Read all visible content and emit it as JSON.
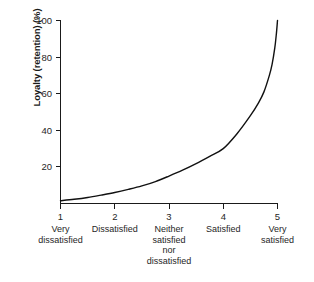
{
  "chart_data": {
    "type": "line",
    "title": "",
    "xlabel": "",
    "ylabel": "Loyalty (retention) (%)",
    "xlim": [
      1,
      5
    ],
    "ylim": [
      0,
      100
    ],
    "grid": false,
    "legend": "none",
    "x_tick_labels": [
      "1",
      "2",
      "3",
      "4",
      "5"
    ],
    "x_category_labels": [
      "Very\ndissatisfied",
      "Dissatisfied",
      "Neither\nsatisfied\nnor\ndissatisfied",
      "Satisfied",
      "Very\nsatisfied"
    ],
    "x_categories": [
      [
        "Very",
        "dissatisfied"
      ],
      [
        "Dissatisfied"
      ],
      [
        "Neither",
        "satisfied",
        "nor",
        "dissatisfied"
      ],
      [
        "Satisfied"
      ],
      [
        "Very",
        "satisfied"
      ]
    ],
    "y_tick_labels": [
      "20",
      "40",
      "60",
      "80",
      "100"
    ],
    "y_ticks": [
      20,
      40,
      60,
      80,
      100
    ],
    "series": [
      {
        "name": "Loyalty (retention)",
        "color": "#111111",
        "x": [
          1.0,
          1.25,
          1.5,
          1.75,
          2.0,
          2.25,
          2.5,
          2.75,
          3.0,
          3.25,
          3.5,
          3.75,
          4.0,
          4.25,
          4.5,
          4.65,
          4.75,
          4.85,
          4.9,
          4.95,
          4.98,
          5.0
        ],
        "y": [
          1.5,
          2.3,
          3.3,
          4.6,
          6.0,
          7.7,
          9.6,
          12.0,
          15.0,
          18.2,
          21.8,
          25.8,
          30.0,
          38.0,
          48.0,
          55.0,
          61.0,
          70.0,
          76.0,
          85.0,
          93.0,
          100.0
        ]
      }
    ],
    "axis_color": "#1a1a1a",
    "background_color": "#ffffff"
  },
  "figure": {
    "background_color": "#ffffff"
  }
}
